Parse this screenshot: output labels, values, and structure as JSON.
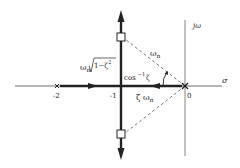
{
  "diagram": {
    "axes": {
      "real_axis_label": "σ",
      "imag_axis_label": "jω"
    },
    "ticks": {
      "minus_two": "-2",
      "minus_one": "-1",
      "zero": "0"
    },
    "poles": [
      {
        "label": "-2",
        "marker": "x"
      },
      {
        "label": "0",
        "marker": "x"
      }
    ],
    "closed_loop_poles": [
      {
        "marker": "square",
        "position": "upper"
      },
      {
        "marker": "square",
        "position": "lower"
      }
    ],
    "annotations": {
      "omega_n": "ω",
      "omega_n_sub": "n",
      "damped_freq_prefix": "ω",
      "damped_freq_sub": "n",
      "damped_freq_root": "1−ζ",
      "damped_freq_sup": "2",
      "angle_prefix": "cos",
      "angle_sup": "−1",
      "angle_suffix": "ζ",
      "zeta_omega": "ζ ω",
      "zeta_omega_sub": "n"
    },
    "colors": {
      "line": "#222222",
      "background": "#ffffff"
    }
  }
}
